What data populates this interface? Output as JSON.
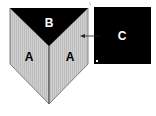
{
  "diagram": {
    "labels": {
      "a_left": "A",
      "a_right": "A",
      "b": "B",
      "c": "C"
    },
    "colors": {
      "face_a": "#c8c8c8",
      "face_b": "#000000",
      "box_c": "#000000",
      "label_light": "#ffffff",
      "label_dark": "#000000",
      "edge": "#555555"
    }
  }
}
